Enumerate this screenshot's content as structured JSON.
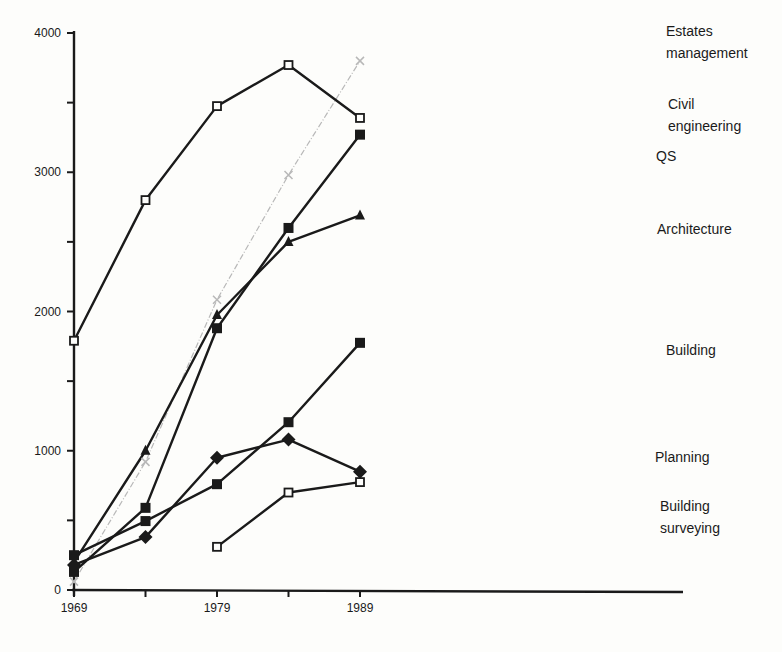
{
  "chart_data": {
    "type": "line",
    "title": "",
    "xlabel": "",
    "ylabel": "",
    "x": [
      1969,
      1974,
      1979,
      1984,
      1989
    ],
    "x_tick_labels": [
      "1969",
      "",
      "1979",
      "",
      "1989"
    ],
    "y_ticks": [
      0,
      500,
      1000,
      1500,
      2000,
      2500,
      3000,
      3500,
      4000
    ],
    "y_tick_labels": [
      "0",
      "",
      "1000",
      "",
      "2000",
      "",
      "3000",
      "",
      "4000"
    ],
    "ylim": [
      0,
      4000
    ],
    "xlim": [
      1969,
      1991
    ],
    "grid": false,
    "legend_position": "inline labels at right end of lines",
    "series": [
      {
        "name": "Estates management",
        "label_lines": [
          "Estates",
          "management"
        ],
        "values": [
          60,
          920,
          2085,
          2980,
          3800
        ],
        "color": "#b8b8b8",
        "marker": "x",
        "width": 1.2
      },
      {
        "name": "Civil engineering",
        "label_lines": [
          "Civil",
          "engineering"
        ],
        "values": [
          1790,
          2800,
          3475,
          3770,
          3390
        ],
        "color": "#1a1a1a",
        "marker": "open-square",
        "width": 2.4
      },
      {
        "name": "QS",
        "label_lines": [
          "QS"
        ],
        "values": [
          130,
          590,
          1880,
          2600,
          3270
        ],
        "color": "#1a1a1a",
        "marker": "filled-square",
        "width": 2.4
      },
      {
        "name": "Architecture",
        "label_lines": [
          "Architecture"
        ],
        "values": [
          200,
          1000,
          1975,
          2500,
          2690
        ],
        "color": "#1a1a1a",
        "marker": "filled-triangle",
        "width": 2.4
      },
      {
        "name": "Building",
        "label_lines": [
          "Building"
        ],
        "values": [
          250,
          495,
          760,
          1205,
          1775
        ],
        "color": "#1a1a1a",
        "marker": "filled-square",
        "width": 2.4
      },
      {
        "name": "Planning",
        "label_lines": [
          "Planning"
        ],
        "values": [
          180,
          380,
          950,
          1080,
          850
        ],
        "color": "#1a1a1a",
        "marker": "filled-diamond",
        "width": 2.4
      },
      {
        "name": "Building surveying",
        "label_lines": [
          "Building",
          "surveying"
        ],
        "values": [
          null,
          null,
          310,
          700,
          775
        ],
        "color": "#1a1a1a",
        "marker": "open-square",
        "width": 2.4
      }
    ]
  },
  "labels": {
    "positions": {
      "Estates management": [
        666,
        24
      ],
      "Civil engineering": [
        668,
        97
      ],
      "QS": [
        656,
        149
      ],
      "Architecture": [
        657,
        222
      ],
      "Building": [
        666,
        343
      ],
      "Planning": [
        655,
        450
      ],
      "Building surveying": [
        660,
        499
      ]
    }
  }
}
